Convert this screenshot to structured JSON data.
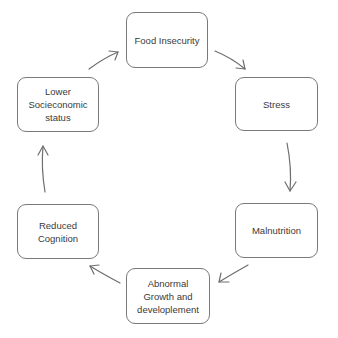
{
  "diagram": {
    "type": "cycle",
    "nodes": [
      {
        "id": "food",
        "label": "Food Insecurity"
      },
      {
        "id": "stress",
        "label": "Stress"
      },
      {
        "id": "maln",
        "label": "Malnutrition"
      },
      {
        "id": "abn",
        "label": "Abnormal\nGrowth and\ndeveloplement"
      },
      {
        "id": "cog",
        "label": "Reduced\nCognition"
      },
      {
        "id": "ses",
        "label": "Lower\nSocieconomic\nstatus"
      }
    ],
    "edges": [
      {
        "from": "food",
        "to": "stress"
      },
      {
        "from": "stress",
        "to": "maln"
      },
      {
        "from": "maln",
        "to": "abn"
      },
      {
        "from": "abn",
        "to": "cog"
      },
      {
        "from": "cog",
        "to": "ses"
      },
      {
        "from": "ses",
        "to": "food"
      }
    ],
    "colors": {
      "border": "#7a7a7a",
      "arrow": "#6e6e6e",
      "text": "#3a3a3a",
      "background": "#ffffff"
    }
  }
}
